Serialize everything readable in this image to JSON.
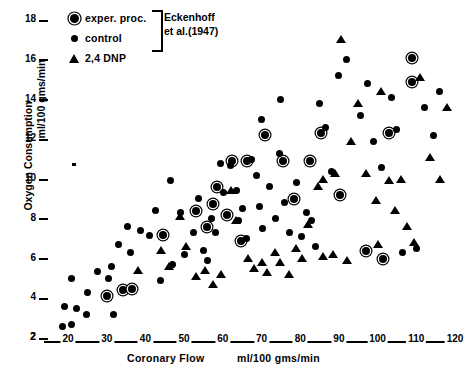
{
  "chart_data": {
    "type": "scatter",
    "title": "",
    "xlabel": "Coronary Flow",
    "xlabel_units": "ml/100 gms/min",
    "ylabel": "Oxygen Consumption",
    "ylabel_units": "ml/100 gms/min",
    "xlim": [
      10,
      120
    ],
    "ylim": [
      2,
      18
    ],
    "xticks": [
      20,
      30,
      40,
      50,
      60,
      70,
      80,
      90,
      100,
      110,
      120
    ],
    "yticks": [
      2,
      4,
      6,
      8,
      10,
      12,
      14,
      16,
      18
    ],
    "x_axis_origin_label": "2",
    "grid": false,
    "legend_position": "top-left",
    "legend_bracket_note": "Eckenhoff et al.(1947)",
    "series": [
      {
        "name": "exper. proc.",
        "key": "exper",
        "marker": "circled-dot",
        "color": "#000000",
        "points": [
          [
            30.2,
            4.1
          ],
          [
            34.2,
            4.4
          ],
          [
            36.6,
            4.45
          ],
          [
            44.6,
            7.2
          ],
          [
            53.0,
            8.4
          ],
          [
            55.8,
            7.6
          ],
          [
            58.4,
            9.6
          ],
          [
            57.5,
            8.75
          ],
          [
            62.5,
            10.9
          ],
          [
            61.0,
            8.2
          ],
          [
            66.2,
            10.9
          ],
          [
            64.6,
            6.9
          ],
          [
            71.0,
            12.2
          ],
          [
            75.6,
            10.9
          ],
          [
            78.4,
            9.0
          ],
          [
            82.6,
            10.9
          ],
          [
            85.5,
            12.3
          ],
          [
            90.2,
            9.2
          ],
          [
            97.0,
            6.4
          ],
          [
            101.5,
            6.0
          ],
          [
            108.8,
            14.9
          ],
          [
            108.8,
            16.1
          ],
          [
            103.0,
            12.3
          ]
        ]
      },
      {
        "name": "control",
        "key": "control",
        "marker": "dot",
        "color": "#000000",
        "points": [
          [
            18.5,
            2.6
          ],
          [
            20.8,
            2.7
          ],
          [
            19.2,
            3.6
          ],
          [
            22.2,
            3.5
          ],
          [
            21.0,
            5.0
          ],
          [
            25.0,
            4.3
          ],
          [
            27.6,
            5.35
          ],
          [
            30.4,
            5.0
          ],
          [
            31.2,
            5.6
          ],
          [
            33.0,
            6.7
          ],
          [
            36.2,
            6.3
          ],
          [
            31.8,
            3.2
          ],
          [
            24.8,
            3.2
          ],
          [
            41.0,
            7.15
          ],
          [
            44.0,
            4.9
          ],
          [
            47.0,
            5.7
          ],
          [
            50.2,
            6.2
          ],
          [
            49.0,
            8.3
          ],
          [
            52.5,
            7.3
          ],
          [
            53.8,
            9.0
          ],
          [
            55.0,
            6.4
          ],
          [
            57.0,
            8.0
          ],
          [
            56.0,
            5.9
          ],
          [
            59.4,
            10.8
          ],
          [
            60.2,
            9.3
          ],
          [
            62.0,
            10.7
          ],
          [
            63.5,
            9.4
          ],
          [
            58.0,
            7.3
          ],
          [
            64.0,
            7.9
          ],
          [
            65.2,
            8.5
          ],
          [
            66.0,
            7.0
          ],
          [
            67.4,
            11.0
          ],
          [
            68.6,
            10.2
          ],
          [
            69.5,
            8.6
          ],
          [
            70.2,
            7.5
          ],
          [
            72.0,
            9.6
          ],
          [
            73.5,
            8.0
          ],
          [
            74.6,
            11.3
          ],
          [
            76.0,
            8.8
          ],
          [
            77.2,
            7.3
          ],
          [
            79.0,
            9.8
          ],
          [
            80.4,
            7.1
          ],
          [
            81.5,
            8.3
          ],
          [
            83.0,
            7.9
          ],
          [
            85.0,
            13.8
          ],
          [
            86.5,
            12.6
          ],
          [
            88.0,
            10.4
          ],
          [
            84.0,
            6.6
          ],
          [
            90.0,
            15.2
          ],
          [
            92.0,
            16.0
          ],
          [
            95.5,
            13.2
          ],
          [
            97.4,
            14.8
          ],
          [
            99.0,
            11.9
          ],
          [
            101.0,
            10.6
          ],
          [
            103.5,
            14.1
          ],
          [
            105.0,
            12.5
          ],
          [
            106.5,
            6.3
          ],
          [
            110.0,
            6.5
          ],
          [
            112.0,
            13.6
          ],
          [
            114.5,
            12.2
          ],
          [
            116.0,
            14.4
          ],
          [
            42.5,
            8.4
          ],
          [
            38.8,
            7.4
          ],
          [
            35.5,
            7.6
          ],
          [
            46.5,
            9.9
          ],
          [
            70.0,
            13.0
          ],
          [
            75.0,
            14.0
          ]
        ]
      },
      {
        "name": "2,4 DNP",
        "key": "dnp",
        "marker": "triangle",
        "color": "#000000",
        "points": [
          [
            38.0,
            5.4
          ],
          [
            44.0,
            6.4
          ],
          [
            46.0,
            5.6
          ],
          [
            49.0,
            8.1
          ],
          [
            50.5,
            6.6
          ],
          [
            53.0,
            5.1
          ],
          [
            55.5,
            5.4
          ],
          [
            57.5,
            4.7
          ],
          [
            59.5,
            5.2
          ],
          [
            62.0,
            9.4
          ],
          [
            63.5,
            7.9
          ],
          [
            66.5,
            6.0
          ],
          [
            68.0,
            5.5
          ],
          [
            70.0,
            5.8
          ],
          [
            71.5,
            5.3
          ],
          [
            73.5,
            6.3
          ],
          [
            74.8,
            5.8
          ],
          [
            77.0,
            5.2
          ],
          [
            79.0,
            6.5
          ],
          [
            80.5,
            6.0
          ],
          [
            82.0,
            7.7
          ],
          [
            84.5,
            9.6
          ],
          [
            85.8,
            10.0
          ],
          [
            89.0,
            10.3
          ],
          [
            90.5,
            17.0
          ],
          [
            93.0,
            11.9
          ],
          [
            95.0,
            13.8
          ],
          [
            97.0,
            10.3
          ],
          [
            99.5,
            8.9
          ],
          [
            101.0,
            14.4
          ],
          [
            103.0,
            9.9
          ],
          [
            104.5,
            8.4
          ],
          [
            106.0,
            10.0
          ],
          [
            107.5,
            7.6
          ],
          [
            109.5,
            6.8
          ],
          [
            111.0,
            15.1
          ],
          [
            113.5,
            11.1
          ],
          [
            116.0,
            10.0
          ],
          [
            118.0,
            13.6
          ],
          [
            100.0,
            6.7
          ],
          [
            86.0,
            6.1
          ],
          [
            88.5,
            6.2
          ],
          [
            92.0,
            5.9
          ]
        ]
      }
    ],
    "stray_marker": {
      "x": 21.0,
      "y": 10.8,
      "note": "small tick mark left of plot"
    }
  },
  "legend": {
    "items": [
      {
        "label": "exper. proc.",
        "symbol": "circled-dot-icon"
      },
      {
        "label": "control",
        "symbol": "dot-icon"
      },
      {
        "label": "2,4 DNP",
        "symbol": "triangle-icon"
      }
    ],
    "citation_line1": "Eckenhoff",
    "citation_line2": "et al.(1947)"
  }
}
